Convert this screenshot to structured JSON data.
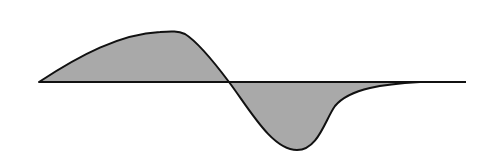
{
  "diagram": {
    "colors": {
      "background": "#ffffff",
      "fill": "#a9a9a9",
      "stroke": "#111111"
    },
    "baseline": {
      "x1": 39,
      "x2": 466,
      "y": 82
    },
    "positive_lobe": {
      "start": [
        39,
        82
      ],
      "peak": [
        168,
        32
      ],
      "end": [
        229,
        82
      ]
    },
    "negative_lobe": {
      "start": [
        229,
        82
      ],
      "trough": [
        297,
        150
      ],
      "shoulder": [
        335,
        105
      ],
      "end": [
        420,
        82
      ]
    }
  }
}
